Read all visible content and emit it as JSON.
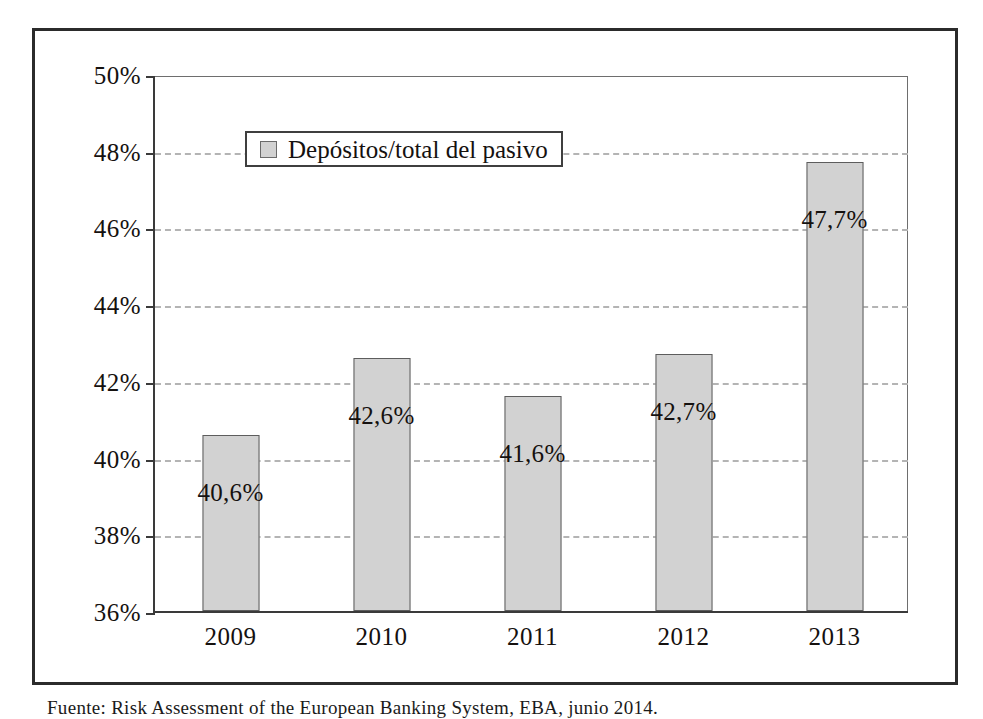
{
  "figure": {
    "source_caption": "Fuente: Risk Assessment of the European Banking System, EBA, junio 2014."
  },
  "legend": {
    "swatch_icon": "legend-swatch-icon",
    "label": "Depósitos/total del pasivo",
    "swatch_color": "#d2d2d2"
  },
  "chart_data": {
    "type": "bar",
    "title": "",
    "subtitle": "",
    "xlabel": "",
    "ylabel": "",
    "categories": [
      "2009",
      "2010",
      "2011",
      "2012",
      "2013"
    ],
    "values": [
      40.6,
      42.6,
      41.6,
      42.7,
      47.7
    ],
    "data_labels": [
      "40,6%",
      "42,6%",
      "41,6%",
      "42,7%",
      "47,7%"
    ],
    "series": [
      {
        "name": "Depósitos/total del pasivo",
        "values": [
          40.6,
          42.6,
          41.6,
          42.7,
          47.7
        ],
        "color": "#d2d2d2"
      }
    ],
    "ylim": [
      36,
      50
    ],
    "ytick_step": 2,
    "ytick_labels": [
      "50%",
      "48%",
      "46%",
      "44%",
      "42%",
      "40%",
      "38%",
      "36%"
    ],
    "ytick_values": [
      50,
      48,
      46,
      44,
      42,
      40,
      38,
      36
    ],
    "gridlines": {
      "horizontal": true,
      "values": [
        48,
        46,
        44,
        42,
        40,
        38
      ],
      "style": "dashed",
      "color": "#b4b4b4"
    },
    "legend_position": "top-left-inside",
    "bar_fill": "#d2d2d2",
    "bar_border": "#5d5d5d",
    "axis_color": "#3a3a3a"
  }
}
